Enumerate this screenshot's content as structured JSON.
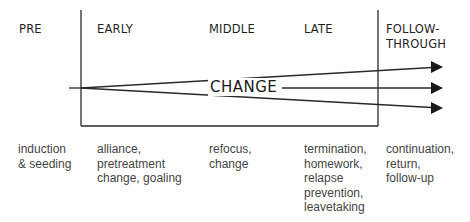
{
  "phases": [
    {
      "label": "PRE",
      "description": "induction\n& seeding"
    },
    {
      "label": "EARLY",
      "description": "alliance,\npretreatment\nchange, goaling"
    },
    {
      "label": "MIDDLE",
      "description": "refocus,\nchange"
    },
    {
      "label": "LATE",
      "description": "termination,\nhomework,\nrelapse\nprevention,\nleavetaking"
    },
    {
      "label": "FOLLOW-\nTHROUGH",
      "description": "continuation,\nreturn,\nfollow-up"
    }
  ],
  "center_label": "CHANGE",
  "arrows": {
    "count": 3,
    "colors": {
      "line": "#2a2a2a",
      "arrowhead": "#1a1a1a"
    }
  }
}
